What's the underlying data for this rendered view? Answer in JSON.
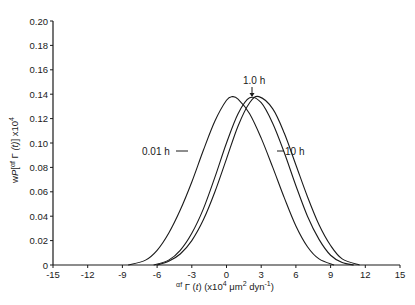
{
  "chart_data": {
    "type": "line",
    "title": "",
    "xlabel": "αf Γ (t) (x10⁴ μm² dyn⁻¹)",
    "ylabel": "wP[αf Γ (t)] x10⁴",
    "xlim": [
      -15,
      15
    ],
    "ylim": [
      0,
      0.2
    ],
    "xticks": [
      -15,
      -12,
      -9,
      -6,
      -3,
      0,
      3,
      6,
      9,
      12,
      15
    ],
    "yticks": [
      0,
      0.02,
      0.04,
      0.06,
      0.08,
      0.1,
      0.12,
      0.14,
      0.16,
      0.18,
      0.2
    ],
    "ytick_labels": [
      "0",
      "0.02",
      "0.04",
      "0.06",
      "0.08",
      "0.10",
      "0.12",
      "0.14",
      "0.16",
      "0.18",
      "0.20"
    ],
    "grid": false,
    "legend": "inline annotations",
    "series": [
      {
        "name": "0.01 h",
        "peak_x": 0.5,
        "peak_y": 0.138,
        "start_x": -8.5,
        "end_x": 9.3,
        "x": [
          -8.5,
          -7,
          -6,
          -5,
          -4,
          -3,
          -2,
          -1,
          0,
          0.5,
          1,
          2,
          3,
          4,
          5,
          6,
          7,
          8,
          9.3
        ],
        "y": [
          0,
          0.004,
          0.012,
          0.026,
          0.045,
          0.068,
          0.094,
          0.118,
          0.135,
          0.138,
          0.136,
          0.124,
          0.104,
          0.08,
          0.055,
          0.032,
          0.015,
          0.005,
          0
        ]
      },
      {
        "name": "1.0 h",
        "peak_x": 2.0,
        "peak_y": 0.137,
        "start_x": -6.3,
        "end_x": 11.0,
        "x": [
          -6.3,
          -5,
          -4,
          -3,
          -2,
          -1,
          0,
          1,
          2,
          3,
          4,
          5,
          6,
          7,
          8,
          9,
          10,
          11.0
        ],
        "y": [
          0,
          0.004,
          0.012,
          0.026,
          0.046,
          0.072,
          0.1,
          0.124,
          0.137,
          0.133,
          0.116,
          0.092,
          0.065,
          0.04,
          0.021,
          0.008,
          0.002,
          0
        ]
      },
      {
        "name": "10 h",
        "peak_x": 2.8,
        "peak_y": 0.138,
        "start_x": -6.0,
        "end_x": 11.5,
        "x": [
          -6.0,
          -5,
          -4,
          -3,
          -2,
          -1,
          0,
          1,
          2,
          2.8,
          4,
          5,
          6,
          7,
          8,
          9,
          10,
          11.5
        ],
        "y": [
          0,
          0.003,
          0.009,
          0.02,
          0.037,
          0.06,
          0.087,
          0.114,
          0.133,
          0.138,
          0.128,
          0.108,
          0.082,
          0.056,
          0.033,
          0.016,
          0.005,
          0
        ]
      }
    ],
    "annotations": [
      {
        "text": "0.01 h",
        "points_to": "0.01 h curve left flank"
      },
      {
        "text": "1.0 h",
        "points_to": "1.0 h curve peak (arrow down)"
      },
      {
        "text": "10 h",
        "points_to": "10 h curve right flank"
      }
    ]
  },
  "labels": {
    "ylabel_parts": {
      "pre": "w",
      "P": "P",
      "alpha": "αf",
      "gamma": "Γ",
      "t": "(t)",
      "post": "] x10",
      "sup": "4"
    },
    "xlabel_parts": {
      "alpha": "αf",
      "rest1": " Γ (",
      "t": "t",
      "rest2": ") (x10",
      "sup4": "4",
      "mu": " μm",
      "sup2": "2",
      "dyn": " dyn",
      "supm1": "-1",
      "close": ")"
    },
    "annot_001": "0.01 h",
    "annot_10h_1": "1.0 h",
    "annot_10h": "10 h"
  }
}
